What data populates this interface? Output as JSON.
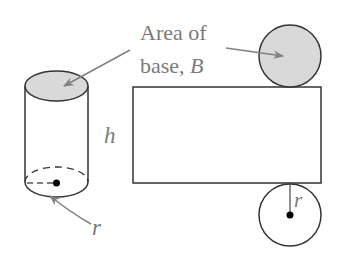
{
  "diagram": {
    "labels": {
      "area_line1": "Area of",
      "area_line2_prefix": "base, ",
      "area_line2_var": "B",
      "height": "h",
      "radius_cylinder": "r",
      "radius_net": "r"
    },
    "colors": {
      "stroke": "#333333",
      "base_fill": "#d9d9d9",
      "label": "#7a7a7a",
      "arrow": "#808080"
    },
    "components": [
      "cylinder",
      "rectangle-lateral-surface",
      "top-base-circle",
      "bottom-base-circle"
    ]
  }
}
